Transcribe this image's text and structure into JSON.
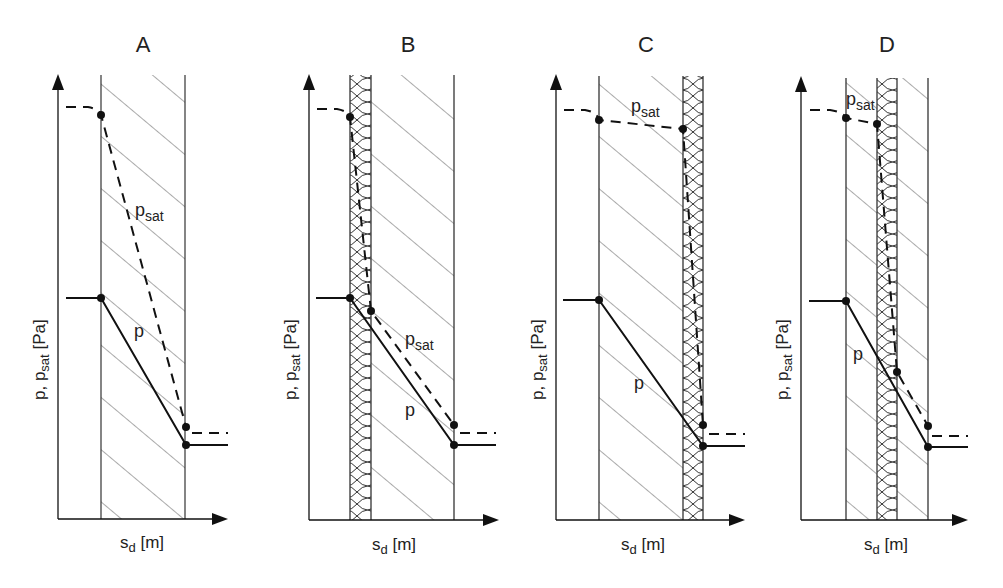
{
  "diagram": {
    "type": "vapor pressure profiles through wall constructions",
    "colors": {
      "line": "#1a1a1a",
      "hatch": "#444444",
      "background": "#ffffff"
    },
    "y_axis_label": {
      "main": "p, p",
      "sub": "sat",
      "unit": " [Pa]"
    },
    "x_axis_label": {
      "main": "s",
      "sub": "d",
      "unit": " [m]"
    },
    "curve_labels": {
      "psat_main": "p",
      "psat_sub": "sat",
      "p": "p"
    },
    "panels": [
      {
        "id": "A",
        "title": "A",
        "layers": [
          "masonry"
        ]
      },
      {
        "id": "B",
        "title": "B",
        "layers": [
          "insulation (inside)",
          "masonry"
        ]
      },
      {
        "id": "C",
        "title": "C",
        "layers": [
          "masonry",
          "insulation (outside)"
        ]
      },
      {
        "id": "D",
        "title": "D",
        "layers": [
          "masonry",
          "insulation (core)",
          "masonry"
        ]
      }
    ]
  }
}
